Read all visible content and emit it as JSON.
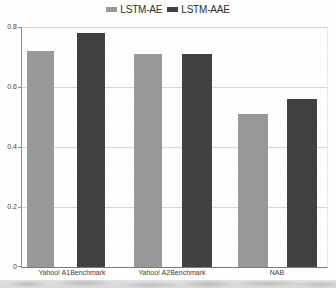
{
  "chart_data": {
    "type": "bar",
    "title": "",
    "xlabel": "",
    "ylabel": "",
    "categories": [
      "Yahoo! A1Benchmark",
      "Yahoo! A2Benchmark",
      "NAB"
    ],
    "series": [
      {
        "name": "LSTM-AE",
        "color": "#98999a",
        "values": [
          0.72,
          0.71,
          0.51
        ]
      },
      {
        "name": "LSTM-AAE",
        "color": "#3e4041",
        "values": [
          0.78,
          0.71,
          0.56
        ]
      }
    ],
    "ylim": [
      0,
      0.8
    ],
    "yticks": [
      0,
      0.2,
      0.4,
      0.6,
      0.8
    ],
    "ytick_labels": [
      "0",
      "0.2",
      "0.4",
      "0.6",
      "0.8"
    ],
    "grid": true,
    "legend_position": "top-center"
  },
  "colors": {
    "background": "#ffffff",
    "gridline": "#d8d8d8",
    "axis": "#7a7a7a",
    "tick_text": "#454545",
    "legend_text": "#2e2e2e"
  }
}
